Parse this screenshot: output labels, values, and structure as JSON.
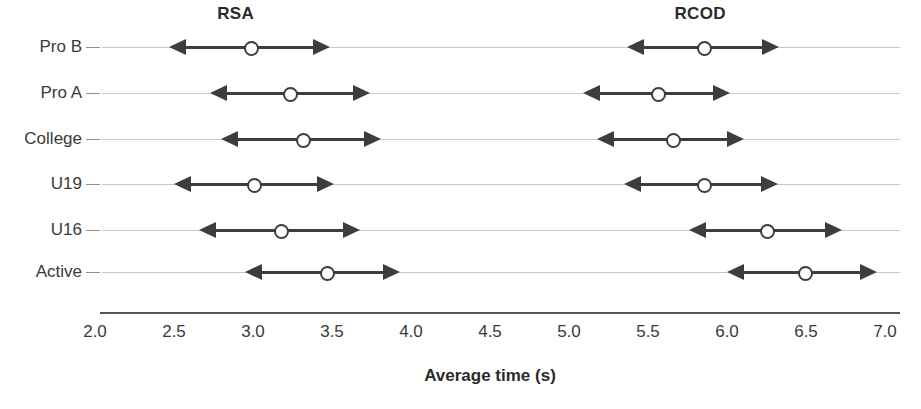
{
  "chart_data": {
    "type": "scatter",
    "title": "",
    "xlabel": "Average time (s)",
    "ylabel": "",
    "xlim": [
      2.0,
      7.0
    ],
    "grid": false,
    "legend_position": "top",
    "xticks": [
      "2.0",
      "2.5",
      "3.0",
      "3.5",
      "4.0",
      "4.5",
      "5.0",
      "5.5",
      "6.0",
      "6.5",
      "7.0"
    ],
    "xtick_values": [
      2.0,
      2.5,
      3.0,
      3.5,
      4.0,
      4.5,
      5.0,
      5.5,
      6.0,
      6.5,
      7.0
    ],
    "categories": [
      "Pro B",
      "Pro A",
      "College",
      "U19",
      "U16",
      "Active"
    ],
    "groups": [
      {
        "name": "RSA",
        "label_x": 2.89
      },
      {
        "name": "RCOD",
        "label_x": 5.83
      }
    ],
    "series": [
      {
        "name": "RSA",
        "points": [
          {
            "category": "Pro B",
            "mean": 2.98,
            "low": 2.47,
            "high": 3.49
          },
          {
            "category": "Pro A",
            "mean": 3.23,
            "low": 2.73,
            "high": 3.74
          },
          {
            "category": "College",
            "mean": 3.31,
            "low": 2.8,
            "high": 3.81
          },
          {
            "category": "U19",
            "mean": 3.0,
            "low": 2.5,
            "high": 3.51
          },
          {
            "category": "U16",
            "mean": 3.17,
            "low": 2.66,
            "high": 3.68
          },
          {
            "category": "Active",
            "mean": 3.46,
            "low": 2.95,
            "high": 3.93
          }
        ]
      },
      {
        "name": "RCOD",
        "points": [
          {
            "category": "Pro B",
            "mean": 5.85,
            "low": 5.37,
            "high": 6.33
          },
          {
            "category": "Pro A",
            "mean": 5.56,
            "low": 5.09,
            "high": 6.02
          },
          {
            "category": "College",
            "mean": 5.65,
            "low": 5.18,
            "high": 6.11
          },
          {
            "category": "U19",
            "mean": 5.85,
            "low": 5.35,
            "high": 6.32
          },
          {
            "category": "U16",
            "mean": 6.25,
            "low": 5.76,
            "high": 6.73
          },
          {
            "category": "Active",
            "mean": 6.49,
            "low": 6.0,
            "high": 6.95
          }
        ]
      }
    ],
    "colors": {
      "marker": "#3d3d3d",
      "row_rule": "#c9c9c9",
      "axis": "#555555",
      "text": "#2b2b2b",
      "background": "#ffffff"
    }
  },
  "layout": {
    "plot_left_px": 95,
    "plot_right_px": 885,
    "row_y_px": [
      47,
      93,
      139,
      184,
      230,
      272
    ],
    "axis_y_px": 312,
    "tick_label_y_px": 322,
    "axis_title_y_px": 366,
    "label_right_px": 82,
    "axis_line_left_px": 100,
    "axis_line_right_px": 900
  }
}
